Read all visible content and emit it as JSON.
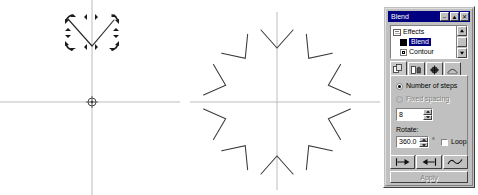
{
  "canvas": {
    "name": "drawing-canvas",
    "ruler_guide_color": "#b9b9b9",
    "shape_color": "#2b2b2b",
    "selection": {
      "label": "rotation-selection-handles",
      "center_marker": "rotation-center-marker"
    },
    "source_shape": {
      "name": "v-shape-original",
      "description": "V shaped open polyline with rotate/skew handles"
    },
    "blend_result": {
      "name": "radial-blend-result",
      "count": 10,
      "description": "Ten rotated copies of the V shape arranged around a common center"
    }
  },
  "docker": {
    "title": "Blend",
    "titlebar_buttons": [
      {
        "name": "rollup-button",
        "glyph": "–"
      },
      {
        "name": "maximize-button",
        "glyph": "▲"
      },
      {
        "name": "close-button",
        "glyph": "✕"
      }
    ],
    "tree": {
      "root": {
        "label": "Effects",
        "icon": "folder-icon"
      },
      "items": [
        {
          "label": "Blend",
          "selected": true,
          "icon": "effect-icon"
        },
        {
          "label": "Contour",
          "selected": false,
          "icon": "effect-icon"
        }
      ],
      "scrollbar": {
        "name": "tree-scrollbar",
        "up": "▲",
        "down": "▼"
      }
    },
    "tabs": [
      {
        "name": "tab-steps",
        "icon": "blend-steps-icon",
        "active": true
      },
      {
        "name": "tab-color",
        "icon": "color-blend-icon",
        "active": false
      },
      {
        "name": "tab-acceleration",
        "icon": "node-map-icon",
        "active": false
      },
      {
        "name": "tab-path",
        "icon": "blend-path-icon",
        "active": false
      }
    ],
    "options": {
      "number_of_steps": {
        "label": "Number of steps",
        "checked": true,
        "enabled": true
      },
      "fixed_spacing": {
        "label": "Fixed spacing",
        "checked": false,
        "enabled": false
      },
      "steps_value": "8",
      "rotate_label": "Rotate:",
      "rotate_value": "360.0",
      "degree_symbol": "°",
      "loop_label": "Loop",
      "loop_checked": false
    },
    "buttons": [
      {
        "name": "blend-start-button",
        "icon": "start-object-icon"
      },
      {
        "name": "blend-end-button",
        "icon": "end-object-icon"
      },
      {
        "name": "blend-path-button",
        "icon": "path-curve-icon"
      }
    ],
    "apply_label": "Apply",
    "apply_enabled": false
  }
}
